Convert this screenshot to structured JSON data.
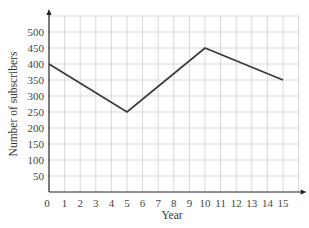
{
  "chart_data": {
    "type": "line",
    "title": "",
    "xlabel": "Year",
    "ylabel": "Number of subscribers",
    "x": [
      0,
      5,
      10,
      15
    ],
    "series": [
      {
        "name": "Subscribers",
        "values": [
          400,
          250,
          450,
          350
        ]
      }
    ],
    "xlim": [
      0,
      16
    ],
    "ylim": [
      0,
      550
    ],
    "xticks": [
      0,
      1,
      2,
      3,
      4,
      5,
      6,
      7,
      8,
      9,
      10,
      11,
      12,
      13,
      14,
      15
    ],
    "yticks": [
      50,
      100,
      150,
      200,
      250,
      300,
      350,
      400,
      450,
      500
    ],
    "grid": true,
    "legend": null,
    "line_color": "#3a3a3a",
    "grid_color": "#cfcfcf"
  }
}
